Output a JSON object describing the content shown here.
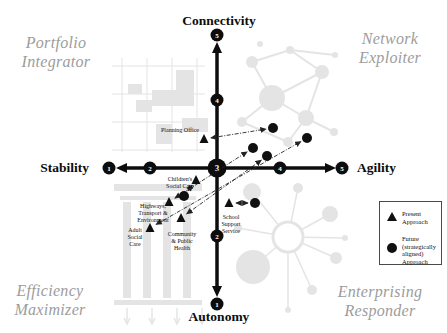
{
  "figure": {
    "axes": {
      "horizontal": {
        "left_label": "Stability",
        "right_label": "Agility",
        "y": 168,
        "x_start": 122,
        "x_end": 330,
        "ticks": [
          {
            "value": "1",
            "x": 109
          },
          {
            "value": "2",
            "x": 150
          },
          {
            "value": "3",
            "x": 217,
            "center": true
          },
          {
            "value": "4",
            "x": 280
          },
          {
            "value": "5",
            "x": 342
          }
        ]
      },
      "vertical": {
        "top_label": "Connectivity",
        "bottom_label": "Autonomy",
        "x": 217,
        "y_start": 48,
        "y_end": 290,
        "ticks": [
          {
            "value": "5",
            "y": 35
          },
          {
            "value": "4",
            "y": 100
          },
          {
            "value": "2",
            "y": 236
          },
          {
            "value": "1",
            "y": 304
          }
        ]
      }
    },
    "quadrants": [
      {
        "position": "top-left",
        "label": "Portfolio\nIntegrator",
        "cx": 56,
        "cy": 52
      },
      {
        "position": "top-right",
        "label": "Network\nExploiter",
        "cx": 390,
        "cy": 48
      },
      {
        "position": "bottom-left",
        "label": "Efficiency\nMaximizer",
        "cx": 50,
        "cy": 300
      },
      {
        "position": "bottom-right",
        "label": "Enterprising\nResponder",
        "cx": 380,
        "cy": 301
      }
    ],
    "legend": {
      "x": 379,
      "y": 201,
      "w": 63,
      "h": 64,
      "present_label": "Present\nApproach",
      "future_label": "Future\n(strategically\naligned)\nApproach"
    },
    "services": [
      {
        "name": "Planning Office",
        "label_lines": "Planning Office",
        "label_x": 180,
        "label_y": 130,
        "present_x": 204,
        "present_y": 139,
        "future_x": 273,
        "future_y": 128,
        "approx_units": {
          "present": [
            2.8,
            3.4
          ],
          "future": [
            3.9,
            3.6
          ]
        }
      },
      {
        "name": "Children's Social Care",
        "label_lines": "Children's\nSocial Care",
        "label_x": 180,
        "label_y": 183,
        "present_x": 196,
        "present_y": 180,
        "future_x": 184,
        "future_y": 196,
        "approx_units": {
          "present": [
            2.7,
            2.8
          ],
          "future": [
            2.5,
            2.6
          ]
        }
      },
      {
        "name": "Highways, Transport & Environment",
        "label_lines": "Highways,\nTransport &\nEnvironment",
        "label_x": 153,
        "label_y": 213,
        "present_x": 169,
        "present_y": 202,
        "future_x": 253,
        "future_y": 148,
        "approx_units": {
          "present": [
            2.3,
            2.5
          ],
          "future": [
            3.6,
            3.3
          ]
        }
      },
      {
        "name": "Adult Social Care",
        "label_lines": "Adult\nSocial\nCare",
        "label_x": 135,
        "label_y": 237,
        "present_x": 150,
        "present_y": 228,
        "future_x": 307,
        "future_y": 138,
        "approx_units": {
          "present": [
            2.0,
            2.1
          ],
          "future": [
            4.4,
            3.4
          ]
        }
      },
      {
        "name": "Community & Public Health",
        "label_lines": "Community\n& Public\nHealth",
        "label_x": 182,
        "label_y": 241,
        "present_x": 181,
        "present_y": 218,
        "future_x": 267,
        "future_y": 156,
        "approx_units": {
          "present": [
            2.5,
            2.3
          ],
          "future": [
            3.8,
            3.2
          ]
        }
      },
      {
        "name": "School Support Service",
        "label_lines": "School\nSupport\nService",
        "label_x": 231,
        "label_y": 224,
        "present_x": 229,
        "present_y": 203,
        "future_x": 255,
        "future_y": 203,
        "approx_units": {
          "present": [
            3.2,
            2.5
          ],
          "future": [
            3.6,
            2.5
          ]
        }
      }
    ],
    "colors": {
      "marker": "#101010",
      "axis": "#0d0d0d",
      "connector": "#222222",
      "quadrant_label": "#9c9c9c",
      "background_motif": "#dcdcdc"
    },
    "background_motifs": [
      "floor-plan-grid",
      "network-graph",
      "classical-building",
      "hub-spoke-network"
    ]
  }
}
